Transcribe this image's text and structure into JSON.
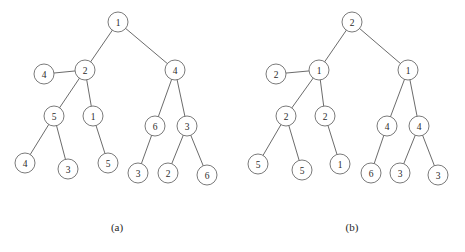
{
  "figure": {
    "background_color": "#ffffff",
    "ink_color": "#5a5a5a",
    "node_fill": "#ffffff",
    "node_stroke": "#6b6b6b",
    "label_color": "#2a2a2a",
    "node_radius": 10
  },
  "captions": {
    "left": "(a)",
    "right": "(b)"
  },
  "chart_data": {
    "type": "diagram",
    "title": "",
    "subtitle": "",
    "diagram_kind": "binary-tree-pair",
    "panels": [
      {
        "id": "a",
        "caption": "(a)",
        "caption_x": 117,
        "caption_y": 227,
        "nodes": [
          {
            "id": "a0",
            "label": "1",
            "x": 118,
            "y": 22
          },
          {
            "id": "a1",
            "label": "2",
            "x": 85,
            "y": 70
          },
          {
            "id": "a2",
            "label": "4",
            "x": 175,
            "y": 70
          },
          {
            "id": "a3",
            "label": "4",
            "x": 44,
            "y": 74
          },
          {
            "id": "a4",
            "label": "5",
            "x": 54,
            "y": 116
          },
          {
            "id": "a5",
            "label": "1",
            "x": 93,
            "y": 116
          },
          {
            "id": "a6",
            "label": "6",
            "x": 155,
            "y": 126
          },
          {
            "id": "a7",
            "label": "3",
            "x": 187,
            "y": 126
          },
          {
            "id": "a8",
            "label": "4",
            "x": 25,
            "y": 163
          },
          {
            "id": "a9",
            "label": "3",
            "x": 68,
            "y": 169
          },
          {
            "id": "a10",
            "label": "5",
            "x": 108,
            "y": 163
          },
          {
            "id": "a11",
            "label": "3",
            "x": 138,
            "y": 173
          },
          {
            "id": "a12",
            "label": "2",
            "x": 168,
            "y": 173
          },
          {
            "id": "a13",
            "label": "6",
            "x": 207,
            "y": 175
          }
        ],
        "edges": [
          {
            "from": "a0",
            "to": "a1"
          },
          {
            "from": "a0",
            "to": "a2"
          },
          {
            "from": "a1",
            "to": "a3"
          },
          {
            "from": "a1",
            "to": "a4"
          },
          {
            "from": "a1",
            "to": "a5"
          },
          {
            "from": "a2",
            "to": "a6"
          },
          {
            "from": "a2",
            "to": "a7"
          },
          {
            "from": "a4",
            "to": "a8"
          },
          {
            "from": "a4",
            "to": "a9"
          },
          {
            "from": "a5",
            "to": "a10"
          },
          {
            "from": "a6",
            "to": "a11"
          },
          {
            "from": "a7",
            "to": "a12"
          },
          {
            "from": "a7",
            "to": "a13"
          }
        ]
      },
      {
        "id": "b",
        "caption": "(b)",
        "caption_x": 352,
        "caption_y": 227,
        "nodes": [
          {
            "id": "b0",
            "label": "2",
            "x": 352,
            "y": 22
          },
          {
            "id": "b1",
            "label": "1",
            "x": 319,
            "y": 70
          },
          {
            "id": "b2",
            "label": "1",
            "x": 408,
            "y": 70
          },
          {
            "id": "b3",
            "label": "2",
            "x": 276,
            "y": 74
          },
          {
            "id": "b4",
            "label": "2",
            "x": 286,
            "y": 116
          },
          {
            "id": "b5",
            "label": "2",
            "x": 325,
            "y": 116
          },
          {
            "id": "b6",
            "label": "4",
            "x": 387,
            "y": 126
          },
          {
            "id": "b7",
            "label": "4",
            "x": 419,
            "y": 126
          },
          {
            "id": "b8",
            "label": "5",
            "x": 258,
            "y": 164
          },
          {
            "id": "b9",
            "label": "5",
            "x": 302,
            "y": 170
          },
          {
            "id": "b10",
            "label": "1",
            "x": 340,
            "y": 164
          },
          {
            "id": "b11",
            "label": "6",
            "x": 371,
            "y": 173
          },
          {
            "id": "b12",
            "label": "3",
            "x": 400,
            "y": 173
          },
          {
            "id": "b13",
            "label": "3",
            "x": 438,
            "y": 175
          }
        ],
        "edges": [
          {
            "from": "b0",
            "to": "b1"
          },
          {
            "from": "b0",
            "to": "b2"
          },
          {
            "from": "b1",
            "to": "b3"
          },
          {
            "from": "b1",
            "to": "b4"
          },
          {
            "from": "b1",
            "to": "b5"
          },
          {
            "from": "b2",
            "to": "b6"
          },
          {
            "from": "b2",
            "to": "b7"
          },
          {
            "from": "b4",
            "to": "b8"
          },
          {
            "from": "b4",
            "to": "b9"
          },
          {
            "from": "b5",
            "to": "b10"
          },
          {
            "from": "b6",
            "to": "b11"
          },
          {
            "from": "b7",
            "to": "b12"
          },
          {
            "from": "b7",
            "to": "b13"
          }
        ]
      }
    ]
  }
}
